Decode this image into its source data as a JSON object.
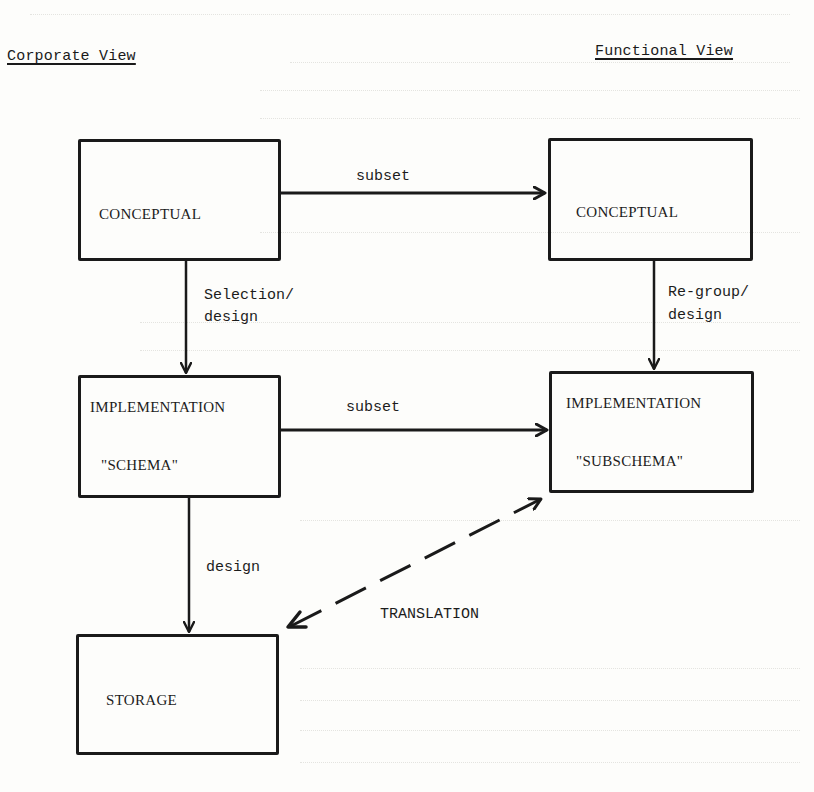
{
  "diagram": {
    "headings": {
      "left": "Corporate View",
      "right": "Functional View"
    },
    "boxes": {
      "corporate_conceptual": {
        "label": "CONCEPTUAL"
      },
      "corporate_implementation": {
        "label": "IMPLEMENTATION",
        "sublabel": "\"SCHEMA\""
      },
      "storage": {
        "label": "STORAGE"
      },
      "functional_conceptual": {
        "label": "CONCEPTUAL"
      },
      "functional_implementation": {
        "label": "IMPLEMENTATION",
        "sublabel": "\"SUBSCHEMA\""
      }
    },
    "edges": {
      "conceptual_subset": {
        "label": "subset",
        "from": "corporate_conceptual",
        "to": "functional_conceptual",
        "style": "solid"
      },
      "implementation_subset": {
        "label": "subset",
        "from": "corporate_implementation",
        "to": "functional_implementation",
        "style": "solid"
      },
      "selection_design": {
        "line1": "Selection/",
        "line2": "design",
        "from": "corporate_conceptual",
        "to": "corporate_implementation",
        "style": "solid"
      },
      "regroup_design": {
        "line1": "Re-group/",
        "line2": "design",
        "from": "functional_conceptual",
        "to": "functional_implementation",
        "style": "solid"
      },
      "storage_design": {
        "label": "design",
        "from": "corporate_implementation",
        "to": "storage",
        "style": "solid"
      },
      "translation": {
        "label": "TRANSLATION",
        "from": "storage",
        "to": "functional_implementation",
        "style": "dashed",
        "bidirectional": true
      }
    },
    "colors": {
      "ink": "#1a1a1a",
      "paper": "#fdfdfb"
    }
  }
}
